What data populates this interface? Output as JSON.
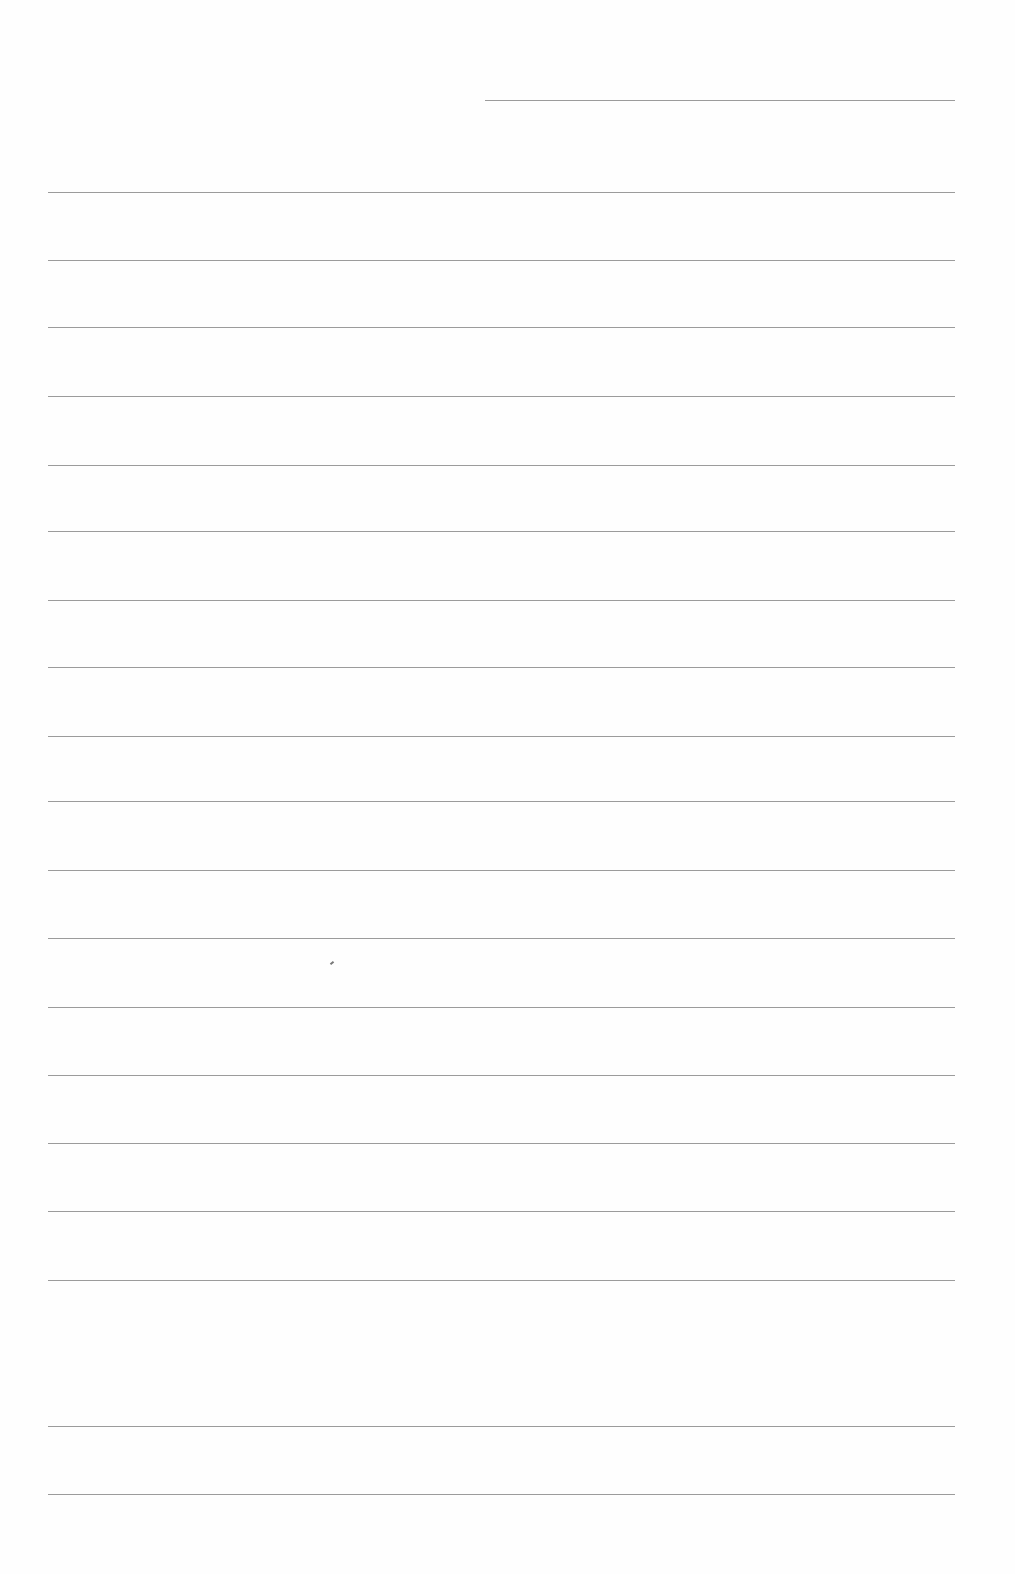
{
  "document": {
    "type": "lined-paper",
    "background": "#fefefe",
    "rule_color": "#8a8a8a",
    "header_rule": {
      "x1": 485,
      "x2": 955,
      "y": 100
    },
    "rules": [
      {
        "x1": 48,
        "x2": 955,
        "y": 192
      },
      {
        "x1": 48,
        "x2": 955,
        "y": 260
      },
      {
        "x1": 48,
        "x2": 955,
        "y": 327
      },
      {
        "x1": 48,
        "x2": 955,
        "y": 396
      },
      {
        "x1": 48,
        "x2": 955,
        "y": 465
      },
      {
        "x1": 48,
        "x2": 955,
        "y": 531
      },
      {
        "x1": 48,
        "x2": 955,
        "y": 600
      },
      {
        "x1": 48,
        "x2": 955,
        "y": 667
      },
      {
        "x1": 48,
        "x2": 955,
        "y": 736
      },
      {
        "x1": 48,
        "x2": 955,
        "y": 801
      },
      {
        "x1": 48,
        "x2": 955,
        "y": 870
      },
      {
        "x1": 48,
        "x2": 955,
        "y": 938
      },
      {
        "x1": 48,
        "x2": 955,
        "y": 1007
      },
      {
        "x1": 48,
        "x2": 955,
        "y": 1075
      },
      {
        "x1": 48,
        "x2": 955,
        "y": 1143
      },
      {
        "x1": 48,
        "x2": 955,
        "y": 1211
      },
      {
        "x1": 48,
        "x2": 955,
        "y": 1280
      },
      {
        "x1": 48,
        "x2": 955,
        "y": 1426
      },
      {
        "x1": 48,
        "x2": 955,
        "y": 1494
      }
    ],
    "marks": [
      {
        "x": 330,
        "y": 962
      }
    ]
  }
}
